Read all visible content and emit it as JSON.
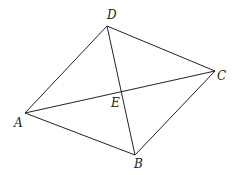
{
  "diagram": {
    "type": "quadrilateral-with-diagonals",
    "stroke_color": "#222222",
    "background": "#ffffff",
    "points": {
      "A": {
        "x": 25,
        "y": 113,
        "label": "A",
        "lx": 14,
        "ly": 127
      },
      "B": {
        "x": 135,
        "y": 155,
        "label": "B",
        "lx": 134,
        "ly": 168
      },
      "C": {
        "x": 215,
        "y": 71,
        "label": "C",
        "lx": 217,
        "ly": 80
      },
      "D": {
        "x": 107,
        "y": 26,
        "label": "D",
        "lx": 107,
        "ly": 19
      },
      "E": {
        "x": 122,
        "y": 91,
        "label": "E",
        "lx": 111,
        "ly": 107
      }
    },
    "sides": [
      [
        "A",
        "B"
      ],
      [
        "B",
        "C"
      ],
      [
        "C",
        "D"
      ],
      [
        "D",
        "A"
      ]
    ],
    "diagonals": [
      [
        "A",
        "C"
      ],
      [
        "B",
        "D"
      ]
    ],
    "labels": [
      "A",
      "B",
      "C",
      "D",
      "E"
    ]
  }
}
